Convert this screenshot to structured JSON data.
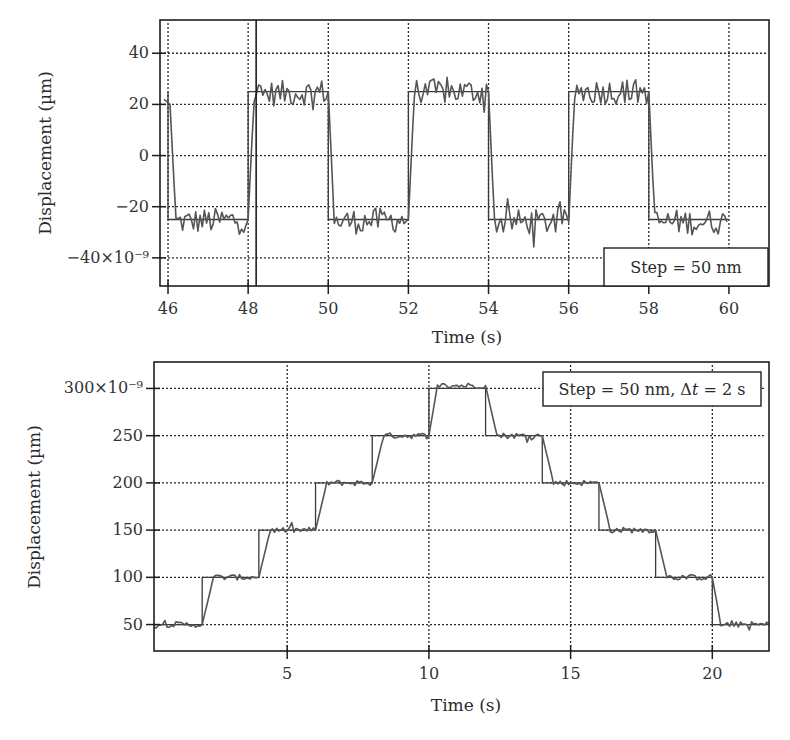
{
  "chart_data": [
    {
      "type": "line",
      "title": "",
      "xlabel": "Time (s)",
      "ylabel": "Displacement (µm)",
      "xlim": [
        45.8,
        61.0
      ],
      "ylim": [
        -51,
        53
      ],
      "x_ticks": [
        46,
        48,
        50,
        52,
        54,
        56,
        58,
        60
      ],
      "x_tick_labels": [
        "46",
        "48",
        "50",
        "52",
        "54",
        "56",
        "58",
        "60"
      ],
      "y_ticks": [
        40,
        20,
        0,
        -20,
        -40
      ],
      "y_tick_labels": [
        "40",
        "20",
        "0",
        "−20",
        "−40×10⁻⁹"
      ],
      "grid": true,
      "legend": {
        "text": "Step = 50 nm",
        "position": "lower right"
      },
      "annotations": [
        {
          "type": "vertical-line",
          "x": 48.2
        }
      ],
      "series": [
        {
          "name": "command (square wave)",
          "style": "step",
          "x": [
            46.0,
            46.0,
            48.0,
            48.0,
            50.0,
            50.0,
            52.0,
            52.0,
            54.0,
            54.0,
            56.0,
            56.0,
            58.0,
            58.0,
            60.0
          ],
          "y": [
            25,
            -25,
            -25,
            25,
            25,
            -25,
            -25,
            25,
            25,
            -25,
            -25,
            25,
            25,
            -25,
            -25
          ]
        },
        {
          "name": "measured displacement (noisy)",
          "style": "noisy",
          "x": [
            45.9,
            46.05,
            46.2,
            48.0,
            48.15,
            50.0,
            50.15,
            52.0,
            52.15,
            54.0,
            54.15,
            56.0,
            56.15,
            58.0,
            58.15,
            59.95
          ],
          "y": [
            22,
            20,
            -26,
            -25,
            24,
            25,
            -26,
            -25,
            25,
            25,
            -26,
            -26,
            25,
            25,
            -26,
            -26
          ],
          "noise_amplitude": 5
        }
      ]
    },
    {
      "type": "line",
      "title": "",
      "xlabel": "Time (s)",
      "ylabel": "Displacement (µm)",
      "xlim": [
        0.3,
        22.0
      ],
      "ylim": [
        22,
        328
      ],
      "x_ticks": [
        5,
        10,
        15,
        20
      ],
      "x_tick_labels": [
        "5",
        "10",
        "15",
        "20"
      ],
      "y_ticks": [
        300,
        250,
        200,
        150,
        100,
        50
      ],
      "y_tick_labels": [
        "300×10⁻⁹",
        "250",
        "200",
        "150",
        "100",
        "50"
      ],
      "grid": true,
      "legend": {
        "text": "Step = 50 nm, Δt = 2 s",
        "position": "upper right"
      },
      "series": [
        {
          "name": "command (staircase)",
          "style": "step",
          "x": [
            0.3,
            2,
            2,
            4,
            4,
            6,
            6,
            8,
            8,
            10,
            10,
            12,
            12,
            14,
            14,
            16,
            16,
            18,
            18,
            20,
            20,
            22
          ],
          "y": [
            50,
            50,
            100,
            100,
            150,
            150,
            200,
            200,
            250,
            250,
            300,
            300,
            250,
            250,
            200,
            200,
            150,
            150,
            100,
            100,
            50,
            50
          ]
        },
        {
          "name": "measured displacement (noisy)",
          "style": "noisy",
          "x": [
            0.3,
            2.0,
            2.4,
            4.0,
            4.4,
            6.0,
            6.4,
            8.0,
            8.4,
            10.0,
            10.3,
            12.0,
            12.4,
            14.0,
            14.4,
            16.0,
            16.4,
            18.0,
            18.4,
            20.0,
            20.3,
            22.0
          ],
          "y": [
            50,
            50,
            100,
            100,
            150,
            150,
            200,
            200,
            250,
            250,
            303,
            303,
            250,
            250,
            200,
            200,
            150,
            150,
            100,
            100,
            50,
            50
          ],
          "noise_amplitude": 3
        }
      ]
    }
  ],
  "charts": {
    "top": {
      "xlabel": "Time (s)",
      "ylabel": "Displacement (µm)",
      "legend": "Step = 50 nm"
    },
    "bottom": {
      "xlabel": "Time (s)",
      "ylabel": "Displacement (µm)",
      "legend_prefix": "Step = 50 nm, Δ",
      "legend_italic": "t",
      "legend_suffix": " = 2 s"
    }
  },
  "colors": {
    "frame": "#1e1e1e",
    "grid": "#2a2a2a",
    "trace": "#555555",
    "command": "#3a3a3a",
    "background": "#ffffff"
  }
}
